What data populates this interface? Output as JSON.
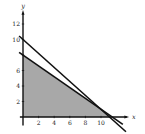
{
  "chart_data": {
    "type": "area",
    "title": "",
    "xlabel": "x",
    "ylabel": "y",
    "xlim": [
      -0.5,
      13.5
    ],
    "ylim": [
      -1,
      13.5
    ],
    "grid": false,
    "x_ticks": [
      2,
      4,
      6,
      8,
      10
    ],
    "y_ticks": [
      2,
      4,
      6,
      8,
      10,
      12
    ],
    "x_tick_labels": [
      "2",
      "4",
      "6",
      "8",
      "10"
    ],
    "y_tick_labels": [
      "2",
      "4",
      "6",
      "10",
      "12"
    ],
    "series": [
      {
        "name": "line-upper",
        "kind": "line",
        "points": [
          [
            -0.5,
            10.45
          ],
          [
            0,
            10
          ],
          [
            10,
            1
          ],
          [
            11.1,
            0
          ],
          [
            13.2,
            -1.9
          ]
        ],
        "y_intercept": 10,
        "x_intercept": 11.1
      },
      {
        "name": "line-lower",
        "kind": "line",
        "points": [
          [
            -0.5,
            8.35
          ],
          [
            0,
            8
          ],
          [
            10,
            1
          ],
          [
            11.4,
            0
          ],
          [
            12.8,
            -0.96
          ]
        ],
        "y_intercept": 8,
        "x_intercept": 11.4
      }
    ],
    "feasible_region": {
      "vertices": [
        [
          0,
          0
        ],
        [
          0,
          8
        ],
        [
          10,
          1
        ],
        [
          11.1,
          0
        ]
      ],
      "fill": "#a8a8a8"
    },
    "colors": {
      "line": "#111111",
      "axis": "#111111",
      "shade": "#a8a8a8"
    }
  }
}
